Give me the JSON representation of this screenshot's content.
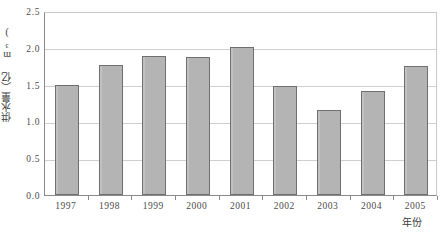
{
  "chart_data": {
    "type": "bar",
    "title": "",
    "xlabel": "年份",
    "ylabel": "供水量（亿 m³)",
    "categories": [
      "1997",
      "1998",
      "1999",
      "2000",
      "2001",
      "2002",
      "2003",
      "2004",
      "2005"
    ],
    "values": [
      1.49,
      1.76,
      1.89,
      1.88,
      2.01,
      1.48,
      1.15,
      1.41,
      1.75
    ],
    "ylim": [
      0.0,
      2.5
    ],
    "ytick_labels": [
      "0.0",
      "0.5",
      "1.0",
      "1.5",
      "2.0",
      "2.5"
    ],
    "ytick_values": [
      0.0,
      0.5,
      1.0,
      1.5,
      2.0,
      2.5
    ],
    "grid": true,
    "grid_axis": "y",
    "legend": "none",
    "bar_fill_color": "#b4b4b4",
    "bar_border_color": "#6f6f6f",
    "gridline_color": "#cfcfcf",
    "axis_color": "#8a8a8a",
    "background_color": "#ffffff"
  }
}
